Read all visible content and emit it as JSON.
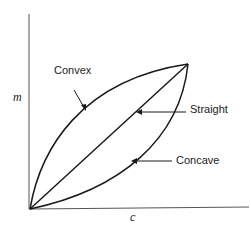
{
  "diagram": {
    "axes": {
      "x_label": "c",
      "y_label": "m"
    },
    "curves": [
      {
        "name": "convex",
        "label": "Convex"
      },
      {
        "name": "straight",
        "label": "Straight"
      },
      {
        "name": "concave",
        "label": "Concave"
      }
    ],
    "colors": {
      "line": "#1a1a1a",
      "axis": "#555555",
      "background": "#ffffff"
    }
  }
}
